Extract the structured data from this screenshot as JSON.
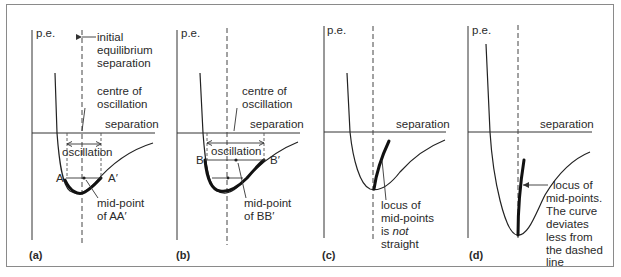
{
  "panels": [
    {
      "id": "a",
      "label": "(a)",
      "y_axis_label": "p.e.",
      "x_axis_label": "separation",
      "annotations": {
        "initial_line1": "initial",
        "initial_line2": "equilibrium",
        "initial_line3": "separation",
        "centre_line1": "centre of",
        "centre_line2": "oscillation",
        "oscillation": "oscillation",
        "left_point": "A",
        "right_point": "A′",
        "mid_line1": "mid-point",
        "mid_line2": "of AA′"
      }
    },
    {
      "id": "b",
      "label": "(b)",
      "y_axis_label": "p.e.",
      "x_axis_label": "separation",
      "annotations": {
        "centre_line1": "centre of",
        "centre_line2": "oscillation",
        "oscillation": "oscillation",
        "left_point": "B",
        "right_point": "B′",
        "mid_line1": "mid-point",
        "mid_line2": "of BB′"
      }
    },
    {
      "id": "c",
      "label": "(c)",
      "y_axis_label": "p.e.",
      "x_axis_label": "separation",
      "annotations": {
        "locus_line1": "locus of",
        "locus_line2": "mid-points",
        "locus_line3_a": "is ",
        "locus_line3_b": "not",
        "locus_line4": "straight"
      }
    },
    {
      "id": "d",
      "label": "(d)",
      "y_axis_label": "p.e.",
      "x_axis_label": "separation",
      "annotations": {
        "locus_line1": "locus of",
        "locus_line2": "mid-points.",
        "locus_line3": "The curve",
        "locus_line4": "deviates",
        "locus_line5": "less from",
        "locus_line6": "the dashed",
        "locus_line7": "line"
      }
    }
  ]
}
